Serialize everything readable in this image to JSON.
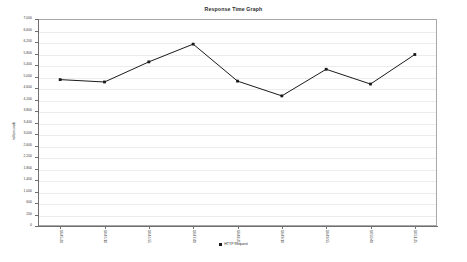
{
  "chart_data": {
    "type": "line",
    "title": "Response Time Graph",
    "xlabel": "",
    "ylabel": "milliseconds",
    "ylim": [
      0,
      7000
    ],
    "grid": true,
    "legend_position": "bottom",
    "y_ticks": [
      "7,000",
      "6,600",
      "6,200",
      "5,800",
      "5,400",
      "5,000",
      "4,600",
      "4,200",
      "3,800",
      "3,400",
      "3,000",
      "2,600",
      "2,200",
      "1,800",
      "1,400",
      "1,000",
      "600",
      "200",
      "0"
    ],
    "categories": [
      "14:45:20",
      "14:46:10",
      "14:46:55",
      "14:47:40",
      "14:48:25",
      "14:49:10",
      "14:49:55",
      "14:50:40",
      "14:51:25"
    ],
    "series": [
      {
        "name": "HTTP Request",
        "color": "#1a1a1a",
        "values": [
          4950,
          4870,
          5550,
          6150,
          4900,
          4400,
          5300,
          4800,
          5800
        ]
      }
    ]
  },
  "legend": {
    "marker": "square-marker",
    "label": "HTTP Request"
  }
}
